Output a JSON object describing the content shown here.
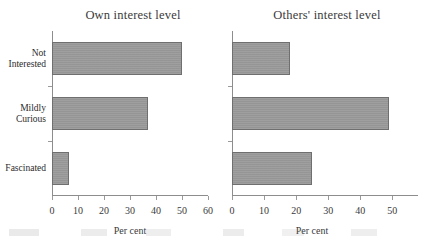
{
  "figure": {
    "background_color": "#ffffff",
    "bar_color": "#9a9a9a",
    "bar_border_color": "#6f6f6f",
    "axis_color": "#8d8d8d"
  },
  "chart_data": [
    {
      "type": "bar",
      "orientation": "horizontal",
      "title": "Own interest level",
      "xlabel": "Per cent",
      "ylabel": "",
      "categories": [
        "Not Interested",
        "Mildly Curious",
        "Fascinated"
      ],
      "values": [
        50,
        37,
        6.5
      ],
      "xlim": [
        0,
        60
      ],
      "xticks": [
        0,
        10,
        20,
        30,
        40,
        50,
        60
      ],
      "xtick_labels": [
        "0",
        "10",
        "20",
        "30",
        "40",
        "50",
        "60"
      ],
      "grid": false,
      "legend": false
    },
    {
      "type": "bar",
      "orientation": "horizontal",
      "title": "Others' interest level",
      "xlabel": "Per cent",
      "ylabel": "",
      "categories": [
        "Not Interested",
        "Mildly Curious",
        "Fascinated"
      ],
      "values": [
        18,
        49,
        25
      ],
      "xlim": [
        0,
        58
      ],
      "xticks": [
        0,
        10,
        20,
        30,
        40,
        50
      ],
      "xtick_labels": [
        "0",
        "10",
        "20",
        "30",
        "40",
        "50"
      ],
      "grid": false,
      "legend": false
    }
  ],
  "left_panel": {
    "title": "Own interest level",
    "axis_title": "Per cent",
    "categories": [
      {
        "line1": "Not",
        "line2": "Interested",
        "value": 50
      },
      {
        "line1": "Mildly",
        "line2": "Curious",
        "value": 37
      },
      {
        "line1": "Fascinated",
        "line2": "",
        "value": 6.5
      }
    ],
    "xtick_labels": [
      "0",
      "10",
      "20",
      "30",
      "40",
      "50",
      "60"
    ]
  },
  "right_panel": {
    "title": "Others' interest level",
    "axis_title": "Per cent",
    "categories": [
      {
        "line1": "",
        "line2": "",
        "value": 18
      },
      {
        "line1": "",
        "line2": "",
        "value": 49
      },
      {
        "line1": "",
        "line2": "",
        "value": 25
      }
    ],
    "xtick_labels": [
      "0",
      "10",
      "20",
      "30",
      "40",
      "50"
    ]
  }
}
